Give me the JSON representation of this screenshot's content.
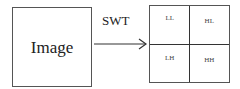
{
  "diagram": {
    "input_label": "Image",
    "transform_label": "SWT",
    "subbands": [
      {
        "label": "LL",
        "position": "top-left"
      },
      {
        "label": "HL",
        "position": "top-right"
      },
      {
        "label": "LH",
        "position": "bottom-left"
      },
      {
        "label": "HH",
        "position": "bottom-right"
      }
    ]
  }
}
